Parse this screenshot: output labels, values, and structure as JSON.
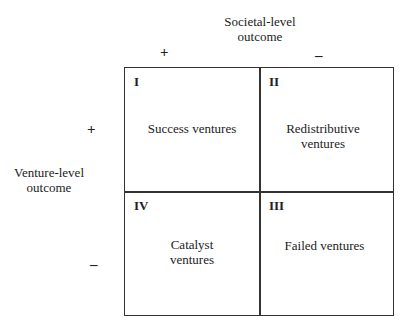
{
  "axes": {
    "societal": {
      "title_line1": "Societal-level",
      "title_line2": "outcome",
      "plus": "+",
      "minus": "–"
    },
    "venture": {
      "title_line1": "Venture-level",
      "title_line2": "outcome",
      "plus": "+",
      "minus": "–"
    }
  },
  "quadrants": [
    {
      "id": "I",
      "label_line1": "Success ventures",
      "label_line2": ""
    },
    {
      "id": "II",
      "label_line1": "Redistributive",
      "label_line2": "ventures"
    },
    {
      "id": "IV",
      "label_line1": "Catalyst",
      "label_line2": "ventures"
    },
    {
      "id": "III",
      "label_line1": "Failed ventures",
      "label_line2": ""
    }
  ]
}
